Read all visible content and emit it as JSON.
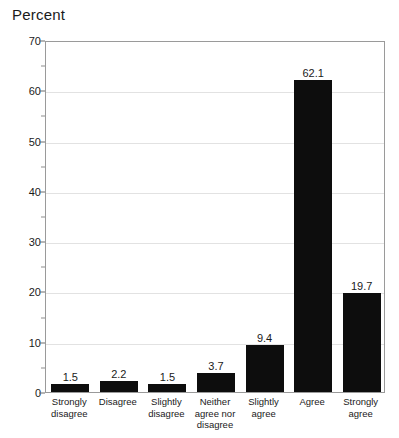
{
  "chart_data": {
    "type": "bar",
    "title": "Percent",
    "xlabel": "",
    "ylabel": "Percent",
    "categories": [
      "Strongly disagree",
      "Disagree",
      "Slightly disagree",
      "Neither agree nor disagree",
      "Slightly agree",
      "Agree",
      "Strongly agree"
    ],
    "category_lines": [
      [
        "Strongly",
        "disagree"
      ],
      [
        "Disagree"
      ],
      [
        "Slightly",
        "disagree"
      ],
      [
        "Neither",
        "agree nor",
        "disagree"
      ],
      [
        "Slightly",
        "agree"
      ],
      [
        "Agree"
      ],
      [
        "Strongly",
        "agree"
      ]
    ],
    "values": [
      1.5,
      2.2,
      1.5,
      3.7,
      9.4,
      62.1,
      19.7
    ],
    "value_labels": [
      "1.5",
      "2.2",
      "1.5",
      "3.7",
      "9.4",
      "62.1",
      "19.7"
    ],
    "ylim": [
      0,
      70
    ],
    "y_ticks": [
      0,
      10,
      20,
      30,
      40,
      50,
      60,
      70
    ],
    "y_tick_labels": [
      "0",
      "10",
      "20",
      "30",
      "40",
      "50",
      "60",
      "70"
    ],
    "y_minor_ticks": [
      5,
      15,
      25,
      35,
      45,
      55,
      65
    ],
    "grid": true,
    "legend": "none",
    "bar_color": "#0d0d0d",
    "grid_color": "#e2e2e2",
    "frame_color": "#9a9a9a",
    "text_color": "#1a1a1a"
  }
}
